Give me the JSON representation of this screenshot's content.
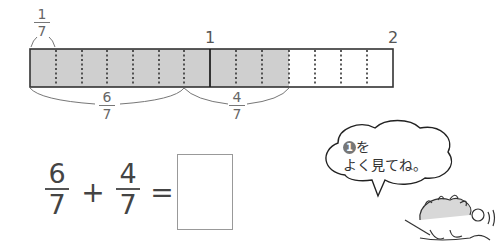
{
  "number_line": {
    "tick_1": "1",
    "tick_2": "2",
    "segments_per_unit": 7,
    "total_segments": 14,
    "shaded_segments": 10,
    "shade_color": "#cfcfcf",
    "unit_label": {
      "num": "1",
      "den": "7"
    },
    "bracket_a": {
      "num": "6",
      "den": "7"
    },
    "bracket_b": {
      "num": "4",
      "den": "7"
    }
  },
  "equation": {
    "term1": {
      "num": "6",
      "den": "7"
    },
    "plus": "+",
    "term2": {
      "num": "4",
      "den": "7"
    },
    "equals": "=",
    "answer": ""
  },
  "speech_bubble": {
    "circled_number": "1",
    "line1_suffix": "を",
    "line2": "よく見てね。"
  }
}
